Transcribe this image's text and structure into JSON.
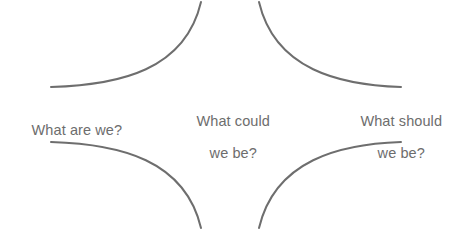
{
  "diagram": {
    "background_color": "#ffffff",
    "stroke_color": "#6e6e6e",
    "text_color": "#6d6d6d",
    "stroke_width": 2,
    "labels": {
      "left": "What are we?",
      "center_line1": "What could",
      "center_line2": "we be?",
      "right_line1": "What should",
      "right_line2": "we be?"
    },
    "arcs": [
      {
        "name": "top-left-arc",
        "path": "M 51 87 C 120 85 185 70 201 2",
        "description": "concave arc from left horizontal to top vertical"
      },
      {
        "name": "top-right-arc",
        "path": "M 259 2 C 275 70 340 85 401 87",
        "description": "concave arc from top vertical to right horizontal"
      },
      {
        "name": "bottom-left-arc",
        "path": "M 51 142 C 120 144 185 160 201 228",
        "description": "concave arc from left horizontal to bottom vertical"
      },
      {
        "name": "bottom-right-arc",
        "path": "M 259 228 C 275 160 340 144 401 142",
        "description": "concave arc from bottom vertical to right horizontal"
      }
    ]
  }
}
